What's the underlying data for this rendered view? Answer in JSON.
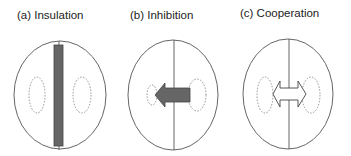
{
  "panels": [
    {
      "id": "a",
      "label": "(a) Insulation",
      "interaction": "insulation",
      "arrow": "bar"
    },
    {
      "id": "b",
      "label": "(b) Inhibition",
      "interaction": "inhibition",
      "arrow": "left-arrow"
    },
    {
      "id": "c",
      "label": "(c) Cooperation",
      "interaction": "cooperation",
      "arrow": "double-arrow"
    }
  ],
  "colors": {
    "outline": "#555555",
    "dashed": "#888888",
    "fill_dark": "#666666",
    "fill_light": "#ffffff"
  }
}
